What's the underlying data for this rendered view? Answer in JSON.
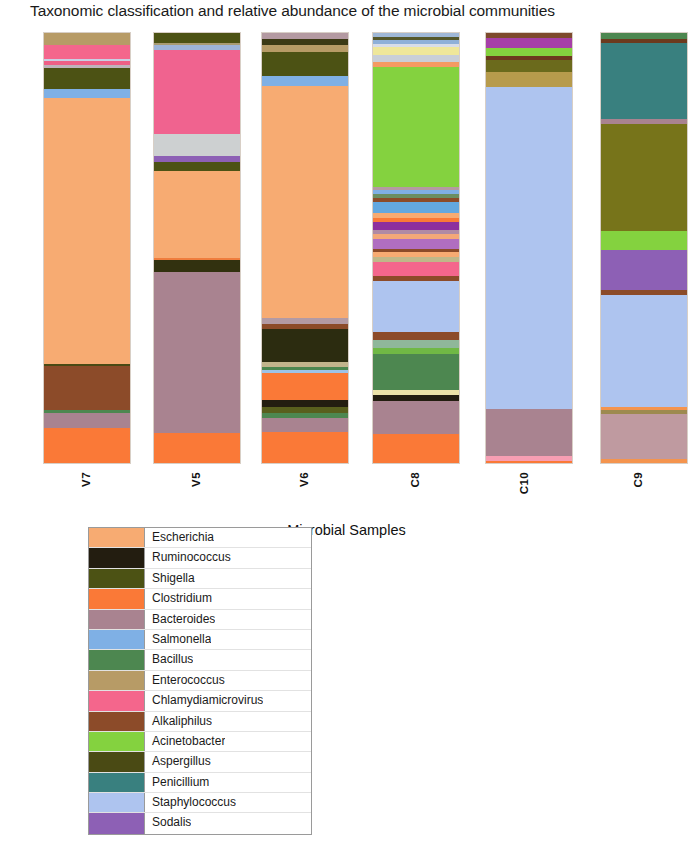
{
  "chart_data": {
    "type": "bar",
    "title": "Taxonomic classification and relative abundance of the microbial communities",
    "xlabel": "Microbial Samples",
    "ylabel": "Relative Percentage",
    "ylim": [
      0,
      100
    ],
    "grid": false,
    "stacked": true,
    "legend_position": "bottom-left",
    "categories": [
      "V7",
      "V5",
      "V6",
      "C8",
      "C10",
      "C9"
    ],
    "legend": [
      {
        "name": "Escherichia",
        "color": "#f7ab72"
      },
      {
        "name": "Ruminococcus",
        "color": "#231d10"
      },
      {
        "name": "Shigella",
        "color": "#4c5214"
      },
      {
        "name": "Clostridium",
        "color": "#fa7937"
      },
      {
        "name": "Bacteroides",
        "color": "#a98390"
      },
      {
        "name": "Salmonella",
        "color": "#7fb0e5"
      },
      {
        "name": "Bacillus",
        "color": "#4d8750"
      },
      {
        "name": "Enterococcus",
        "color": "#b79b66"
      },
      {
        "name": "Chlamydiamicrovirus",
        "color": "#f4668c"
      },
      {
        "name": "Alkaliphilus",
        "color": "#8c4b29"
      },
      {
        "name": "Acinetobacter",
        "color": "#84d23f"
      },
      {
        "name": "Aspergillus",
        "color": "#4a4a14"
      },
      {
        "name": "Penicillium",
        "color": "#39807f"
      },
      {
        "name": "Staphylococcus",
        "color": "#aec4ef"
      },
      {
        "name": "Sodalis",
        "color": "#8d60b5"
      }
    ],
    "series": [
      {
        "name": "V7",
        "segments": [
          {
            "taxon": "Enterococcus",
            "color": "#b79b66",
            "value": 2.8
          },
          {
            "taxon": "Chlamydiamicrovirus",
            "color": "#f4668c",
            "value": 3.2
          },
          {
            "taxon": "Staphylococcus",
            "color": "#c9cfe4",
            "value": 0.5
          },
          {
            "taxon": "Chlamydiamicrovirus",
            "color": "#ef5f86",
            "value": 1.1
          },
          {
            "taxon": "Bacteroides",
            "color": "#bfb3bc",
            "value": 0.5
          },
          {
            "taxon": "Shigella",
            "color": "#4c5214",
            "value": 5.1
          },
          {
            "taxon": "Salmonella",
            "color": "#7fb0e5",
            "value": 2.1
          },
          {
            "taxon": "Escherichia",
            "color": "#f7ab72",
            "value": 62.1
          },
          {
            "taxon": "Aspergillus",
            "color": "#4a4a14",
            "value": 0.5
          },
          {
            "taxon": "Alkaliphilus",
            "color": "#8c4b29",
            "value": 10.2
          },
          {
            "taxon": "Bacillus",
            "color": "#4d8750",
            "value": 0.7
          },
          {
            "taxon": "Bacteroides",
            "color": "#a98390",
            "value": 3.5
          },
          {
            "taxon": "Clostridium",
            "color": "#fa7937",
            "value": 8.2
          }
        ]
      },
      {
        "name": "V5",
        "segments": [
          {
            "taxon": "Shigella",
            "color": "#4c5214",
            "value": 2.3
          },
          {
            "taxon": "Enterococcus",
            "color": "#a89b72",
            "value": 0.6
          },
          {
            "taxon": "Salmonella",
            "color": "#9db4d8",
            "value": 1.1
          },
          {
            "taxon": "Chlamydiamicrovirus",
            "color": "#f0638f",
            "value": 19.6
          },
          {
            "taxon": "Staphylococcus",
            "color": "#cdd0d1",
            "value": 5.1
          },
          {
            "taxon": "Sodalis",
            "color": "#8d60b5",
            "value": 1.2
          },
          {
            "taxon": "Shigella",
            "color": "#4c5214",
            "value": 2.3
          },
          {
            "taxon": "Escherichia",
            "color": "#f7ab72",
            "value": 20.1
          },
          {
            "taxon": "Clostridium",
            "color": "#ef7d3d",
            "value": 0.6
          },
          {
            "taxon": "Aspergillus",
            "color": "#32310f",
            "value": 2.6
          },
          {
            "taxon": "Bacteroides",
            "color": "#a98390",
            "value": 37.5
          },
          {
            "taxon": "Clostridium",
            "color": "#fa7937",
            "value": 7.0
          }
        ]
      },
      {
        "name": "V6",
        "segments": [
          {
            "taxon": "Bacteroides",
            "color": "#b49aa2",
            "value": 1.4
          },
          {
            "taxon": "Aspergillus",
            "color": "#3c3a15",
            "value": 1.2
          },
          {
            "taxon": "Enterococcus",
            "color": "#b79b66",
            "value": 1.6
          },
          {
            "taxon": "Shigella",
            "color": "#4c5214",
            "value": 5.6
          },
          {
            "taxon": "Salmonella",
            "color": "#7fb0e5",
            "value": 2.1
          },
          {
            "taxon": "Escherichia",
            "color": "#f7ab72",
            "value": 52.5
          },
          {
            "taxon": "Bacteroides",
            "color": "#b39aa4",
            "value": 1.2
          },
          {
            "taxon": "Alkaliphilus",
            "color": "#8c4b29",
            "value": 1.2
          },
          {
            "taxon": "Aspergillus",
            "color": "#2c2c10",
            "value": 7.4
          },
          {
            "taxon": "Enterococcus",
            "color": "#c2b48c",
            "value": 1.2
          },
          {
            "taxon": "Bacillus",
            "color": "#4d8750",
            "value": 0.6
          },
          {
            "taxon": "Salmonella",
            "color": "#9dc3e8",
            "value": 0.7
          },
          {
            "taxon": "Clostridium",
            "color": "#fa7937",
            "value": 6.2
          },
          {
            "taxon": "Ruminococcus",
            "color": "#231d10",
            "value": 1.6
          },
          {
            "taxon": "Shigella",
            "color": "#595f1d",
            "value": 1.2
          },
          {
            "taxon": "Bacillus",
            "color": "#4d8750",
            "value": 1.2
          },
          {
            "taxon": "Bacteroides",
            "color": "#a98390",
            "value": 3.2
          },
          {
            "taxon": "Clostridium",
            "color": "#fa7937",
            "value": 6.9
          }
        ]
      },
      {
        "name": "C8",
        "segments": [
          {
            "taxon": "Salmonella",
            "color": "#9fb7d6",
            "value": 0.9
          },
          {
            "taxon": "Aspergillus",
            "color": "#55572a",
            "value": 0.7
          },
          {
            "taxon": "Salmonella",
            "color": "#8fb0d8",
            "value": 1.2
          },
          {
            "taxon": "Staphylococcus",
            "color": "#d8dde8",
            "value": 0.7
          },
          {
            "taxon": "Enterococcus",
            "color": "#efe79a",
            "value": 1.9
          },
          {
            "taxon": "Staphylococcus",
            "color": "#c9cfd8",
            "value": 1.6
          },
          {
            "taxon": "Clostridium",
            "color": "#f49a62",
            "value": 1.4
          },
          {
            "taxon": "Acinetobacter",
            "color": "#84d23f",
            "value": 29.2
          },
          {
            "taxon": "Bacteroides",
            "color": "#b59aa2",
            "value": 0.7
          },
          {
            "taxon": "Salmonella",
            "color": "#7fb0e5",
            "value": 1.2
          },
          {
            "taxon": "Bacillus",
            "color": "#6b8f62",
            "value": 0.9
          },
          {
            "taxon": "Alkaliphilus",
            "color": "#8c4b29",
            "value": 0.9
          },
          {
            "taxon": "Salmonella",
            "color": "#63a8e0",
            "value": 2.8
          },
          {
            "taxon": "Escherichia",
            "color": "#f7ab72",
            "value": 1.2
          },
          {
            "taxon": "Clostridium",
            "color": "#fa7937",
            "value": 0.9
          },
          {
            "taxon": "Sodalis",
            "color": "#8d2f9e",
            "value": 1.9
          },
          {
            "taxon": "Bacteroides",
            "color": "#b08aa4",
            "value": 1.2
          },
          {
            "taxon": "Escherichia",
            "color": "#f3a878",
            "value": 1.2
          },
          {
            "taxon": "Sodalis",
            "color": "#b06ec0",
            "value": 2.3
          },
          {
            "taxon": "Alkaliphilus",
            "color": "#8c4b29",
            "value": 0.7
          },
          {
            "taxon": "Escherichia",
            "color": "#f7ab72",
            "value": 1.4
          },
          {
            "taxon": "Enterococcus",
            "color": "#bfb889",
            "value": 1.2
          },
          {
            "taxon": "Chlamydiamicrovirus",
            "color": "#f4668c",
            "value": 3.5
          },
          {
            "taxon": "Alkaliphilus",
            "color": "#8c4b29",
            "value": 1.2
          },
          {
            "taxon": "Staphylococcus",
            "color": "#aec4ef",
            "value": 12.5
          },
          {
            "taxon": "Alkaliphilus",
            "color": "#8c4b29",
            "value": 1.9
          },
          {
            "taxon": "Bacillus",
            "color": "#8fb79a",
            "value": 1.9
          },
          {
            "taxon": "Acinetobacter",
            "color": "#70b845",
            "value": 1.6
          },
          {
            "taxon": "Bacillus",
            "color": "#4d8750",
            "value": 8.6
          },
          {
            "taxon": "Enterococcus",
            "color": "#ece2a8",
            "value": 1.2
          },
          {
            "taxon": "Ruminococcus",
            "color": "#231d10",
            "value": 1.6
          },
          {
            "taxon": "Bacteroides",
            "color": "#a98390",
            "value": 8.1
          },
          {
            "taxon": "Clostridium",
            "color": "#fa7937",
            "value": 7.0
          }
        ]
      },
      {
        "name": "C10",
        "segments": [
          {
            "taxon": "Alkaliphilus",
            "color": "#7d4a2c",
            "value": 1.2
          },
          {
            "taxon": "Sodalis",
            "color": "#a63fa8",
            "value": 2.3
          },
          {
            "taxon": "Acinetobacter",
            "color": "#84d23f",
            "value": 1.9
          },
          {
            "taxon": "Alkaliphilus",
            "color": "#6c3a1e",
            "value": 0.9
          },
          {
            "taxon": "Shigella",
            "color": "#6b6a1c",
            "value": 2.8
          },
          {
            "taxon": "Enterococcus",
            "color": "#b79b4c",
            "value": 3.5
          },
          {
            "taxon": "Staphylococcus",
            "color": "#aec4ef",
            "value": 74.8
          },
          {
            "taxon": "Bacteroides",
            "color": "#a98390",
            "value": 10.9
          },
          {
            "taxon": "Chlamydiamicrovirus",
            "color": "#f79eb3",
            "value": 1.2
          },
          {
            "taxon": "Clostridium",
            "color": "#fa7937",
            "value": 0.5
          }
        ]
      },
      {
        "name": "C9",
        "segments": [
          {
            "taxon": "Bacillus",
            "color": "#4d8750",
            "value": 1.4
          },
          {
            "taxon": "Alkaliphilus",
            "color": "#6c3a1e",
            "value": 0.9
          },
          {
            "taxon": "Penicillium",
            "color": "#39807f",
            "value": 17.6
          },
          {
            "taxon": "Bacteroides",
            "color": "#a98390",
            "value": 1.2
          },
          {
            "taxon": "Shigella",
            "color": "#77741a",
            "value": 25.0
          },
          {
            "taxon": "Acinetobacter",
            "color": "#84d23f",
            "value": 4.4
          },
          {
            "taxon": "Sodalis",
            "color": "#8d60b5",
            "value": 9.3
          },
          {
            "taxon": "Alkaliphilus",
            "color": "#8c4b29",
            "value": 1.2
          },
          {
            "taxon": "Staphylococcus",
            "color": "#aec4ef",
            "value": 25.9
          },
          {
            "taxon": "Clostridium",
            "color": "#f4944e",
            "value": 0.9
          },
          {
            "taxon": "Enterococcus",
            "color": "#9d8a4f",
            "value": 0.9
          },
          {
            "taxon": "Bacteroides",
            "color": "#bf9aa0",
            "value": 10.4
          },
          {
            "taxon": "Clostridium",
            "color": "#f4944e",
            "value": 0.9
          }
        ]
      }
    ]
  },
  "layout": {
    "bar_x": [
      43,
      153,
      261,
      372,
      485,
      600
    ],
    "bar_width": 88,
    "label_x": [
      80,
      190,
      298,
      409,
      518,
      632
    ]
  }
}
